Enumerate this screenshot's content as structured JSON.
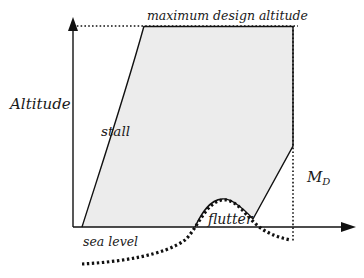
{
  "diagram": {
    "labels": {
      "y_axis": "Altitude",
      "top_limit": "maximum design altitude",
      "left_boundary": "stall",
      "right_limit_main": "M",
      "right_limit_sub": "D",
      "bottom_boundary": "flutter",
      "baseline": "sea level"
    },
    "colors": {
      "envelope_fill": "#ececec",
      "line": "#111111",
      "background": "#ffffff"
    }
  }
}
